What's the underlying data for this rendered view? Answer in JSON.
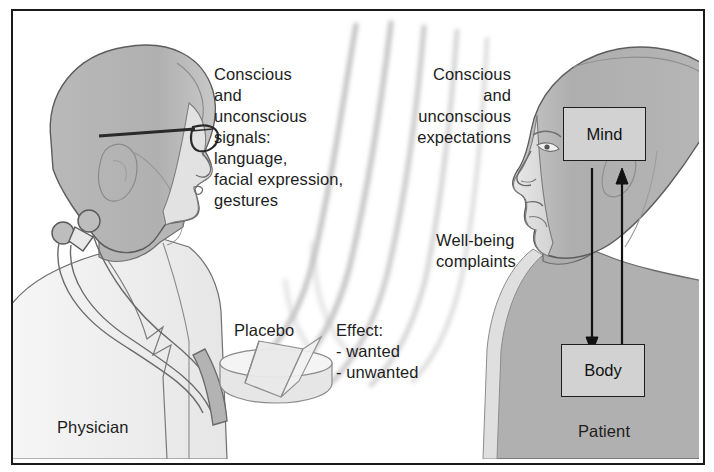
{
  "figure": {
    "border_color": "#1a1a1a",
    "background": "#ffffff"
  },
  "palette": {
    "skin_light": "#dcdcdc",
    "head_gray": "#b4b4b4",
    "head_gray_dark": "#a6a6a6",
    "coat_white": "#f2f2f2",
    "outline": "#4a4a4a",
    "text": "#1d1d1d",
    "wave_gray": "#b9b9b9",
    "box_fill": "#d2d2d2",
    "arrow": "#111111"
  },
  "left_actor": {
    "name": "physician",
    "label": "Physician",
    "label_pos": {
      "x": 55,
      "y": 415
    },
    "features": [
      "glasses",
      "stethoscope",
      "lab-coat"
    ]
  },
  "right_actor": {
    "name": "patient",
    "label": "Patient",
    "label_pos": {
      "x": 576,
      "y": 419
    }
  },
  "text_blocks": [
    {
      "id": "physician_signals",
      "align": "left",
      "pos": {
        "x": 212,
        "y": 62
      },
      "lines": [
        "Conscious",
        "and",
        "unconscious",
        "signals:",
        "language,",
        "facial expression,",
        "gestures"
      ],
      "text": "Conscious\nand\nunconscious\nsignals:\nlanguage,\nfacial expression,\ngestures"
    },
    {
      "id": "patient_expectations",
      "align": "right",
      "pos": {
        "x": 382,
        "y": 62
      },
      "width": 127,
      "lines": [
        "Conscious",
        "and",
        "unconscious",
        "expectations"
      ],
      "text": "Conscious\nand\nunconscious\nexpectations"
    },
    {
      "id": "wellbeing_complaints",
      "align": "left",
      "pos": {
        "x": 434,
        "y": 228
      },
      "lines": [
        "Well-being",
        "complaints"
      ],
      "text": "Well-being\ncomplaints"
    },
    {
      "id": "placebo_label",
      "align": "left",
      "pos": {
        "x": 232,
        "y": 318
      },
      "lines": [
        "Placebo"
      ],
      "text": "Placebo"
    },
    {
      "id": "effect_list",
      "align": "left",
      "pos": {
        "x": 334,
        "y": 318
      },
      "lines": [
        "Effect:",
        "- wanted",
        "- unwanted"
      ],
      "text": "Effect:\n- wanted\n- unwanted"
    }
  ],
  "boxes": [
    {
      "id": "mind",
      "label": "Mind",
      "rect": {
        "x": 561,
        "y": 105,
        "w": 81,
        "h": 52
      }
    },
    {
      "id": "body",
      "label": "Body",
      "rect": {
        "x": 559,
        "y": 342,
        "w": 82,
        "h": 51
      }
    }
  ],
  "arrows": [
    {
      "id": "mind-to-body",
      "direction": "down",
      "from": "Mind",
      "to": "Body"
    },
    {
      "id": "body-to-mind",
      "direction": "up",
      "from": "Body",
      "to": "Mind"
    }
  ],
  "waves": {
    "id": "sound-waves",
    "count": 5,
    "description": "curved gray arcs travelling from physician toward patient"
  },
  "placebo_object": {
    "id": "placebo-tablet",
    "description": "broken round tablet drawn as a split cylinder",
    "pos": {
      "x": 218,
      "y": 340,
      "w": 110,
      "h": 52
    }
  }
}
